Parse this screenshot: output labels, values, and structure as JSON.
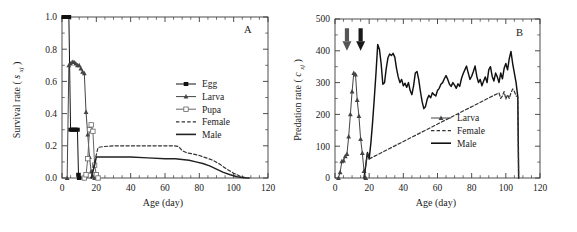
{
  "figure": {
    "panels": [
      "A",
      "B"
    ],
    "background": "#ffffff",
    "ink": "#1a1a1a"
  },
  "panel_a": {
    "letter": "A",
    "legend": [
      {
        "label": "Egg",
        "marker": "filled-square",
        "line": "solid",
        "color": "#111111"
      },
      {
        "label": "Larva",
        "marker": "filled-triangle",
        "line": "solid",
        "color": "#444444"
      },
      {
        "label": "Pupa",
        "marker": "open-square",
        "line": "solid",
        "color": "#666666"
      },
      {
        "label": "Female",
        "marker": "none",
        "line": "dashed",
        "color": "#333333"
      },
      {
        "label": "Male",
        "marker": "none",
        "line": "solid",
        "color": "#222222"
      }
    ],
    "chart_data": {
      "type": "line",
      "title": "",
      "xlabel": "Age (day)",
      "ylabel": "Survival rate (s_xj)",
      "ylabel_main": "Survival rate",
      "ylabel_symbol": "s",
      "ylabel_sub": "xj",
      "xlim": [
        0,
        120
      ],
      "ylim": [
        0.0,
        1.0
      ],
      "xticks": [
        0,
        20,
        40,
        60,
        80,
        100,
        120
      ],
      "yticks": [
        "0.0",
        "0.2",
        "0.4",
        "0.6",
        "0.8",
        "1.0"
      ],
      "ytick_values": [
        0.0,
        0.2,
        0.4,
        0.6,
        0.8,
        1.0
      ],
      "grid": false,
      "legend_position": "center-right",
      "series": [
        {
          "name": "Egg",
          "x": [
            1,
            2,
            3,
            4,
            5,
            6,
            7,
            8,
            9,
            9.6,
            10
          ],
          "values": [
            1.0,
            1.0,
            1.0,
            1.0,
            0.3,
            0.3,
            0.3,
            0.3,
            0.3,
            0.02,
            0.0
          ]
        },
        {
          "name": "Larva",
          "x": [
            3,
            4,
            5,
            6,
            7,
            8,
            9,
            10,
            11,
            12,
            13,
            14,
            15,
            16,
            17,
            18,
            19
          ],
          "values": [
            0.0,
            0.7,
            0.71,
            0.72,
            0.72,
            0.71,
            0.7,
            0.7,
            0.68,
            0.66,
            0.65,
            0.41,
            0.27,
            0.13,
            0.04,
            0.01,
            0.0
          ]
        },
        {
          "name": "Pupa",
          "x": [
            13,
            14,
            15,
            16,
            17,
            18,
            19,
            20,
            21
          ],
          "values": [
            0.0,
            0.02,
            0.12,
            0.3,
            0.33,
            0.29,
            0.08,
            0.02,
            0.0
          ]
        },
        {
          "name": "Female",
          "x": [
            17,
            19,
            21,
            24,
            30,
            40,
            50,
            60,
            65,
            68,
            70,
            73,
            76,
            80,
            84,
            88,
            92,
            96,
            100,
            104,
            108
          ],
          "values": [
            0.0,
            0.1,
            0.19,
            0.195,
            0.2,
            0.2,
            0.2,
            0.2,
            0.2,
            0.195,
            0.17,
            0.155,
            0.15,
            0.14,
            0.125,
            0.11,
            0.085,
            0.055,
            0.03,
            0.01,
            0.0
          ]
        },
        {
          "name": "Male",
          "x": [
            17,
            19,
            20,
            24,
            30,
            40,
            50,
            60,
            66,
            70,
            74,
            78,
            82,
            86,
            90,
            94,
            98,
            102,
            106,
            109
          ],
          "values": [
            0.0,
            0.08,
            0.13,
            0.13,
            0.13,
            0.13,
            0.125,
            0.12,
            0.12,
            0.115,
            0.11,
            0.1,
            0.09,
            0.075,
            0.055,
            0.035,
            0.02,
            0.008,
            0.002,
            0.0
          ]
        }
      ]
    }
  },
  "panel_b": {
    "letter": "B",
    "annotations": [
      {
        "type": "arrow-down",
        "x": 7,
        "y": 430,
        "color": "#555555"
      },
      {
        "type": "arrow-down",
        "x": 15,
        "y": 430,
        "color": "#1a1a1a"
      }
    ],
    "legend": [
      {
        "label": "Larva",
        "marker": "filled-triangle",
        "line": "solid",
        "color": "#444444"
      },
      {
        "label": "Female",
        "marker": "none",
        "line": "dashed",
        "color": "#333333"
      },
      {
        "label": "Male",
        "marker": "none",
        "line": "solid",
        "color": "#111111"
      }
    ],
    "chart_data": {
      "type": "line",
      "title": "",
      "xlabel": "Age (day)",
      "ylabel": "Predation rate (c_xj)",
      "ylabel_main": "Predation rate",
      "ylabel_symbol": "c",
      "ylabel_sub": "xj",
      "xlim": [
        0,
        120
      ],
      "ylim": [
        0,
        500
      ],
      "xticks": [
        0,
        20,
        40,
        60,
        80,
        100,
        120
      ],
      "yticks": [
        "0",
        "100",
        "200",
        "300",
        "400",
        "500"
      ],
      "ytick_values": [
        0,
        100,
        200,
        300,
        400,
        500
      ],
      "grid": false,
      "legend_position": "center-right",
      "series": [
        {
          "name": "Larva",
          "x": [
            2,
            3,
            4,
            5,
            6,
            7,
            8,
            9,
            10,
            11,
            12,
            13,
            14,
            15,
            16,
            17,
            18
          ],
          "values": [
            0,
            18,
            52,
            55,
            68,
            75,
            130,
            200,
            272,
            330,
            325,
            245,
            195,
            122,
            78,
            22,
            0
          ]
        },
        {
          "name": "Male",
          "x": [
            17,
            18,
            19,
            20,
            21,
            22,
            23,
            24,
            25,
            26,
            27,
            28,
            29,
            30,
            31,
            32,
            33,
            34,
            35,
            36,
            37,
            38,
            39,
            40,
            41,
            42,
            43,
            44,
            45,
            46,
            47,
            48,
            49,
            50,
            51,
            52,
            53,
            54,
            55,
            56,
            57,
            58,
            59,
            60,
            61,
            62,
            63,
            64,
            65,
            66,
            67,
            68,
            69,
            70,
            71,
            72,
            73,
            74,
            75,
            76,
            77,
            78,
            79,
            80,
            81,
            82,
            83,
            84,
            85,
            86,
            87,
            88,
            89,
            90,
            91,
            92,
            93,
            94,
            95,
            96,
            97,
            98,
            99,
            100,
            101,
            102,
            103,
            104,
            105,
            106,
            107,
            107.5
          ],
          "values": [
            0,
            40,
            80,
            60,
            110,
            175,
            250,
            330,
            420,
            405,
            360,
            295,
            300,
            345,
            378,
            390,
            385,
            392,
            380,
            345,
            318,
            300,
            310,
            290,
            298,
            285,
            300,
            275,
            262,
            290,
            330,
            335,
            310,
            272,
            240,
            218,
            225,
            248,
            260,
            252,
            268,
            262,
            258,
            275,
            282,
            295,
            300,
            312,
            322,
            310,
            295,
            288,
            300,
            292,
            282,
            296,
            288,
            312,
            328,
            340,
            352,
            330,
            310,
            320,
            335,
            352,
            320,
            300,
            310,
            290,
            305,
            318,
            300,
            340,
            350,
            320,
            305,
            330,
            318,
            300,
            330,
            312,
            345,
            360,
            340,
            375,
            398,
            360,
            330,
            300,
            255,
            0
          ]
        },
        {
          "name": "Female",
          "x": [
            17,
            18,
            19,
            20,
            96,
            97,
            98,
            99,
            100,
            101,
            102,
            103,
            104,
            105,
            106,
            107,
            107.5
          ],
          "values": [
            0,
            40,
            80,
            60,
            268,
            250,
            258,
            272,
            248,
            262,
            250,
            268,
            280,
            272,
            258,
            255,
            0
          ]
        }
      ]
    }
  }
}
